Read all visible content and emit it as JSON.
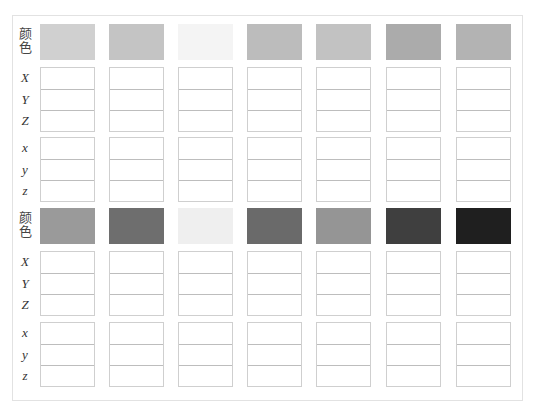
{
  "sheet": {
    "color_label": "颜色",
    "upper_axes": [
      "X",
      "Y",
      "Z"
    ],
    "lower_axes": [
      "x",
      "y",
      "z"
    ],
    "blocks": [
      {
        "swatches": [
          {
            "color": "#d0d0d0"
          },
          {
            "color": "#c4c4c4"
          },
          {
            "color": "#f4f4f4"
          },
          {
            "color": "#bcbcbc"
          },
          {
            "color": "#c2c2c2"
          },
          {
            "color": "#ababab"
          },
          {
            "color": "#b3b3b3"
          }
        ],
        "XYZ_values": [
          [
            "",
            "",
            ""
          ],
          [
            "",
            "",
            ""
          ],
          [
            "",
            "",
            ""
          ],
          [
            "",
            "",
            ""
          ],
          [
            "",
            "",
            ""
          ],
          [
            "",
            "",
            ""
          ],
          [
            "",
            "",
            ""
          ]
        ],
        "xyz_values": [
          [
            "",
            "",
            ""
          ],
          [
            "",
            "",
            ""
          ],
          [
            "",
            "",
            ""
          ],
          [
            "",
            "",
            ""
          ],
          [
            "",
            "",
            ""
          ],
          [
            "",
            "",
            ""
          ],
          [
            "",
            "",
            ""
          ]
        ]
      },
      {
        "swatches": [
          {
            "color": "#9a9a9a"
          },
          {
            "color": "#6e6e6e"
          },
          {
            "color": "#efefef"
          },
          {
            "color": "#6a6a6a"
          },
          {
            "color": "#959595"
          },
          {
            "color": "#3f3f3f"
          },
          {
            "color": "#1f1f1f"
          }
        ],
        "XYZ_values": [
          [
            "",
            "",
            ""
          ],
          [
            "",
            "",
            ""
          ],
          [
            "",
            "",
            ""
          ],
          [
            "",
            "",
            ""
          ],
          [
            "",
            "",
            ""
          ],
          [
            "",
            "",
            ""
          ],
          [
            "",
            "",
            ""
          ]
        ],
        "xyz_values": [
          [
            "",
            "",
            ""
          ],
          [
            "",
            "",
            ""
          ],
          [
            "",
            "",
            ""
          ],
          [
            "",
            "",
            ""
          ],
          [
            "",
            "",
            ""
          ],
          [
            "",
            "",
            ""
          ],
          [
            "",
            "",
            ""
          ]
        ]
      }
    ]
  }
}
